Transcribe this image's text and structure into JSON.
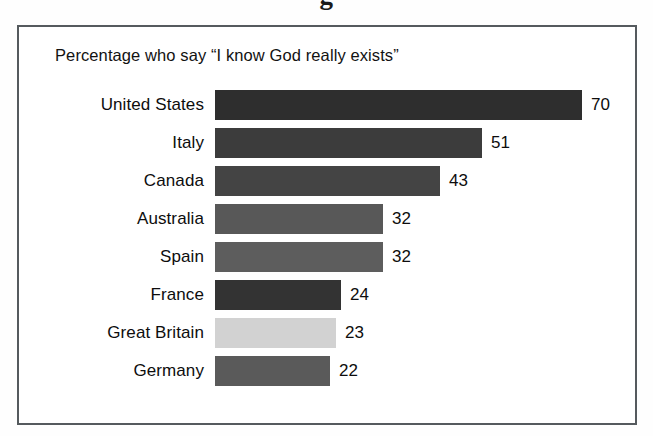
{
  "cut_off_title_fragment": "g",
  "frame": {
    "border_color": "#555a5e",
    "background_color": "#ffffff"
  },
  "caption": "Percentage who say “I know God really exists”",
  "chart_data": {
    "type": "bar",
    "orientation": "horizontal",
    "title": "",
    "subtitle": "Percentage who say “I know God really exists”",
    "xlabel": "",
    "ylabel": "",
    "xlim": [
      0,
      70
    ],
    "grid": false,
    "legend": false,
    "value_labels": true,
    "categories": [
      "United States",
      "Italy",
      "Canada",
      "Australia",
      "Spain",
      "France",
      "Great Britain",
      "Germany"
    ],
    "values": [
      70,
      51,
      43,
      32,
      32,
      24,
      23,
      22
    ],
    "bar_colors": [
      "#2e2e2e",
      "#3c3c3c",
      "#444444",
      "#585858",
      "#5d5d5d",
      "#333333",
      "#d2d2d2",
      "#5a5a5a"
    ],
    "bars": [
      {
        "category": "United States",
        "value": 70,
        "label": "70",
        "color": "#2e2e2e"
      },
      {
        "category": "Italy",
        "value": 51,
        "label": "51",
        "color": "#3c3c3c"
      },
      {
        "category": "Canada",
        "value": 43,
        "label": "43",
        "color": "#444444"
      },
      {
        "category": "Australia",
        "value": 32,
        "label": "32",
        "color": "#585858"
      },
      {
        "category": "Spain",
        "value": 32,
        "label": "32",
        "color": "#5d5d5d"
      },
      {
        "category": "France",
        "value": 24,
        "label": "24",
        "color": "#333333"
      },
      {
        "category": "Great Britain",
        "value": 23,
        "label": "23",
        "color": "#d2d2d2"
      },
      {
        "category": "Germany",
        "value": 22,
        "label": "22",
        "color": "#5a5a5a"
      }
    ]
  },
  "scale": {
    "px_per_unit": 5.24,
    "value_label_gap_px": 9
  }
}
